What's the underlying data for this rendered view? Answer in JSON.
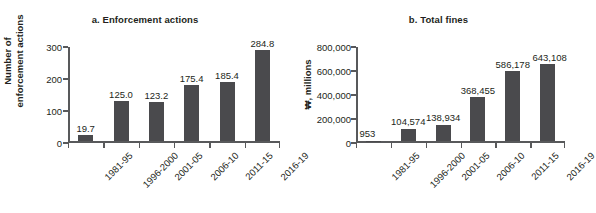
{
  "chart_data": [
    {
      "type": "bar",
      "id": "a",
      "title": "a. Enforcement actions",
      "xlabel": "",
      "ylabel": "Number of\nenforcement actions",
      "categories": [
        "1981-95",
        "1996-2000",
        "2001-05",
        "2006-10",
        "2011-15",
        "2016-19"
      ],
      "values": [
        19.7,
        125.0,
        123.2,
        175.4,
        185.4,
        284.8
      ],
      "value_labels": [
        "19.7",
        "125.0",
        "123.2",
        "175.4",
        "185.4",
        "284.8"
      ],
      "yticks": [
        0,
        100,
        200,
        300
      ],
      "ytick_labels": [
        "0",
        "100",
        "200",
        "300"
      ],
      "ylim": [
        0,
        300
      ],
      "grid": false,
      "legend": "none",
      "bar_color": "#4a4a4d"
    },
    {
      "type": "bar",
      "id": "b",
      "title": "b. Total fines",
      "xlabel": "",
      "ylabel": "₩, millions",
      "categories": [
        "1981-95",
        "1996-2000",
        "2001-05",
        "2006-10",
        "2011-15",
        "2016-19"
      ],
      "values": [
        953,
        104574,
        138934,
        368455,
        586178,
        643108
      ],
      "value_labels": [
        "953",
        "104,574",
        "138,934",
        "368,455",
        "586,178",
        "643,108"
      ],
      "yticks": [
        0,
        200000,
        400000,
        600000,
        800000
      ],
      "ytick_labels": [
        "0",
        "200,000",
        "400,000",
        "600,000",
        "800,000"
      ],
      "ylim": [
        0,
        800000
      ],
      "grid": false,
      "legend": "none",
      "bar_color": "#4a4a4d"
    }
  ]
}
